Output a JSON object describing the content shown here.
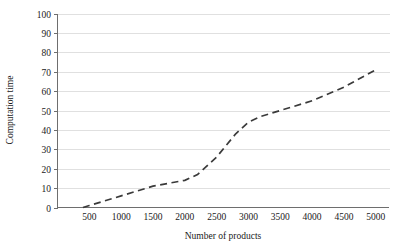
{
  "chart_data": {
    "type": "line",
    "title": "",
    "xlabel": "Number of products",
    "ylabel": "Computation time",
    "xlim": [
      0,
      5200
    ],
    "ylim": [
      0,
      100
    ],
    "grid": "horizontal",
    "legend": "none",
    "line_style": "dashed",
    "line_color": "#3a3a3a",
    "grid_color": "#d8d8d8",
    "axis_color": "#6e6e6e",
    "background_color": "#ffffff",
    "xticks": [
      500,
      1000,
      1500,
      2000,
      2500,
      3000,
      3500,
      4000,
      4500,
      5000
    ],
    "xtick_labels": [
      "500",
      "1000",
      "1500",
      "2000",
      "2500",
      "3000",
      "3500",
      "4000",
      "4500",
      "5000"
    ],
    "yticks": [
      0,
      10,
      20,
      30,
      40,
      50,
      60,
      70,
      80,
      90,
      100
    ],
    "ytick_labels": [
      "0",
      "10",
      "20",
      "30",
      "40",
      "50",
      "60",
      "70",
      "80",
      "90",
      "100"
    ],
    "series": [
      {
        "name": "Computation time",
        "x": [
          400,
          500,
          1000,
          1500,
          2000,
          2200,
          2500,
          2800,
          3000,
          3200,
          3500,
          4000,
          4500,
          5000
        ],
        "values": [
          0,
          1,
          6,
          11,
          14,
          17,
          26,
          38,
          44,
          47,
          50,
          55,
          62,
          71
        ]
      }
    ]
  }
}
